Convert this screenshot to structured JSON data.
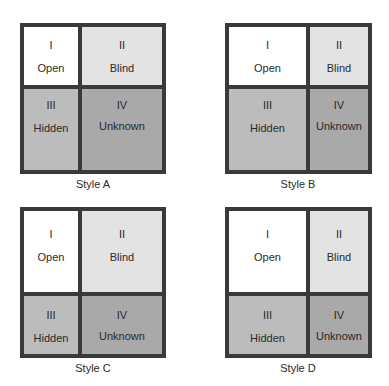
{
  "colors": {
    "border": "#3a3a3a",
    "open": "#ffffff",
    "blind": "#e3e3e3",
    "hidden": "#bcbcbc",
    "unknown": "#a9a9a9"
  },
  "quadrants": {
    "open": {
      "numeral": "I",
      "label": "Open"
    },
    "blind": {
      "numeral": "II",
      "label": "Blind"
    },
    "hidden": {
      "numeral": "III",
      "label": "Hidden"
    },
    "unknown": {
      "numeral": "IV",
      "label": "Unknown"
    }
  },
  "diagrams": [
    {
      "caption": "Style A",
      "layout": "small open, large unknown"
    },
    {
      "caption": "Style B",
      "layout": "large open, small unknown"
    },
    {
      "caption": "Style C",
      "layout": "large blind"
    },
    {
      "caption": "Style D",
      "layout": "large open, small others"
    }
  ]
}
